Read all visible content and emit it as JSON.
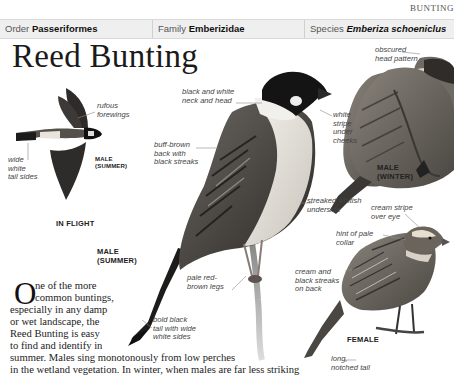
{
  "header": {
    "section": "BUNTING",
    "order_label": "Order",
    "order_value": "Passeriformes",
    "family_label": "Family",
    "family_value": "Emberizidae",
    "species_label": "Species",
    "species_value": "Emberiza schoeniclus"
  },
  "title": "Reed Bunting",
  "illustrations": {
    "in_flight": {
      "caption": "IN FLIGHT",
      "sub_caption_1": "MALE",
      "sub_caption_2": "(SUMMER)",
      "labels": {
        "forewings_1": "rufous",
        "forewings_2": "forewings",
        "tail_1": "wide",
        "tail_2": "white",
        "tail_3": "tail sides"
      }
    },
    "male_summer": {
      "caption_1": "MALE",
      "caption_2": "(SUMMER)",
      "labels": {
        "neck_1": "black and white",
        "neck_2": "neck and head",
        "back_1": "buff-brown",
        "back_2": "back with",
        "back_3": "black streaks",
        "cheek_1": "white",
        "cheek_2": "stripe",
        "cheek_3": "under",
        "cheek_4": "cheeks",
        "underside_1": "streaked whitish",
        "underside_2": "underside",
        "legs_1": "pale red-",
        "legs_2": "brown legs",
        "tail_1": "bold black",
        "tail_2": "tail with wide",
        "tail_3": "white sides"
      }
    },
    "male_winter": {
      "caption_1": "MALE",
      "caption_2": "(WINTER)",
      "labels": {
        "head_1": "obscured",
        "head_2": "head pattern"
      }
    },
    "female": {
      "caption": "FEMALE",
      "labels": {
        "eye_1": "cream stripe",
        "eye_2": "over eye",
        "collar_1": "hint of pale",
        "collar_2": "collar",
        "back_1": "cream and",
        "back_2": "black streaks",
        "back_3": "on back",
        "tail_1": "long,",
        "tail_2": "notched tail"
      }
    }
  },
  "body": {
    "dropcap": "O",
    "line_1": "ne of the more",
    "line_2": "common buntings,",
    "line_3": "especially in any damp",
    "line_4": "or wet landscape, the",
    "line_5": "Reed Bunting is easy",
    "line_6": "to find and identify in",
    "line_7": "summer. Males sing monotonously from low perches",
    "line_8": "in the wetland vegetation. In winter, when males are far less striking"
  }
}
